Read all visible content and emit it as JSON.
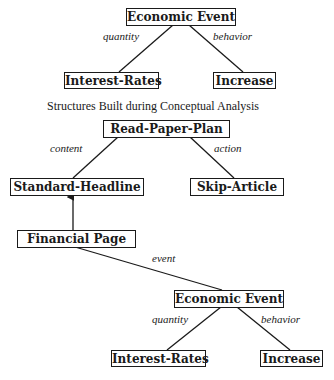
{
  "caption": "Structures Built during Conceptual Analysis",
  "top_tree": {
    "root": "Economic Event",
    "left_child": "Interest-Rates",
    "right_child": "Increase",
    "left_edge": "quantity",
    "right_edge": "behavior"
  },
  "plan_tree": {
    "root": "Read-Paper-Plan",
    "left_child": "Standard-Headline",
    "right_child": "Skip-Article",
    "left_edge": "content",
    "right_edge": "action"
  },
  "financial": {
    "node": "Financial Page",
    "edge": "event"
  },
  "bottom_tree": {
    "root": "Economic Event",
    "left_child": "Interest-Rates",
    "right_child": "Increase",
    "left_edge": "quantity",
    "right_edge": "behavior"
  }
}
